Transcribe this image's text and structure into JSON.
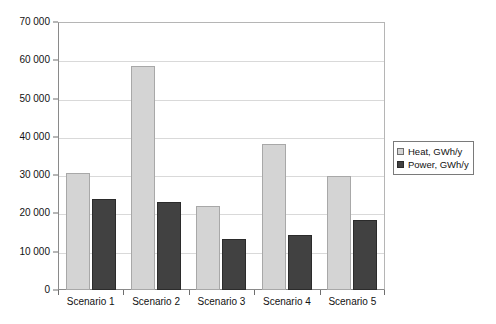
{
  "chart_data": {
    "type": "bar",
    "title": "",
    "subtitle": "",
    "xlabel": "",
    "ylabel": "",
    "categories": [
      "Scenario 1",
      "Scenario 2",
      "Scenario 3",
      "Scenario 4",
      "Scenario 5"
    ],
    "series": [
      {
        "name": "Heat, GWh/y",
        "color": "#d4d4d4",
        "values": [
          30500,
          58500,
          22000,
          38200,
          29800
        ]
      },
      {
        "name": "Power, GWh/y",
        "color": "#414141",
        "values": [
          23800,
          22900,
          13400,
          14400,
          18400
        ]
      }
    ],
    "ylim": [
      0,
      70000
    ],
    "ytick_values": [
      0,
      10000,
      20000,
      30000,
      40000,
      50000,
      60000,
      70000
    ],
    "ytick_labels": [
      "0",
      "10 000",
      "20 000",
      "30 000",
      "40 000",
      "50 000",
      "60 000",
      "70 000"
    ],
    "grid": true,
    "grid_axis": "y",
    "legend_position": "right",
    "legend_entries": [
      "Heat, GWh/y",
      "Power, GWh/y"
    ],
    "annotations": []
  }
}
